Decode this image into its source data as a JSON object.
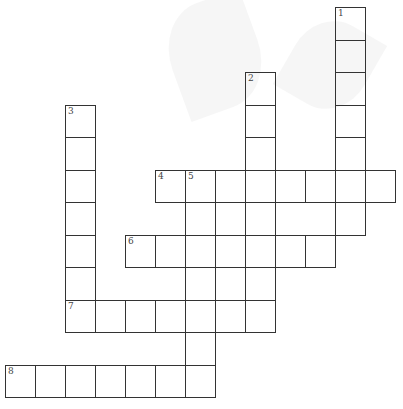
{
  "puzzle": {
    "type": "crossword",
    "cell_width": 30,
    "cell_height": 32.5,
    "origin": {
      "x": 5,
      "y": 7
    },
    "clues": [
      {
        "number": "1",
        "direction": "down",
        "col": 11,
        "row": 0,
        "length": 7
      },
      {
        "number": "2",
        "direction": "down",
        "col": 8,
        "row": 2,
        "length": 7
      },
      {
        "number": "3",
        "direction": "down",
        "col": 2,
        "row": 3,
        "length": 7
      },
      {
        "number": "4",
        "direction": "across",
        "col": 5,
        "row": 5,
        "length": 8
      },
      {
        "number": "5",
        "direction": "down",
        "col": 6,
        "row": 5,
        "length": 7
      },
      {
        "number": "6",
        "direction": "across",
        "col": 4,
        "row": 7,
        "length": 7
      },
      {
        "number": "7",
        "direction": "across",
        "col": 2,
        "row": 9,
        "length": 7
      },
      {
        "number": "8",
        "direction": "across",
        "col": 0,
        "row": 11,
        "length": 7
      }
    ]
  },
  "colors": {
    "grid_line": "#333333",
    "background": "#ffffff",
    "watermark": "#f0f0f0"
  }
}
